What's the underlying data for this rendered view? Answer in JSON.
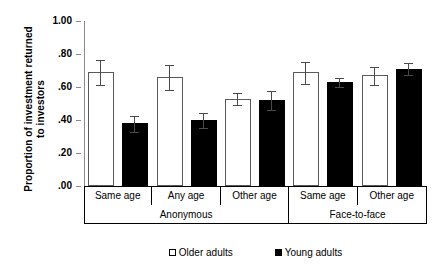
{
  "chart_data": {
    "type": "bar",
    "title": "",
    "xlabel": "",
    "ylabel": "Proportion of investment returned to investors",
    "ylabel_line1": "Proportion of investment returned",
    "ylabel_line2": "to investors",
    "ylim": [
      0.0,
      1.0
    ],
    "ytick_values": [
      0.0,
      0.2,
      0.4,
      0.6,
      0.8,
      1.0
    ],
    "ytick_labels": [
      ".00",
      ".20",
      ".40",
      ".60",
      ".80",
      "1.00"
    ],
    "grid": false,
    "legend_position": "bottom-center",
    "categories": [
      "Same age",
      "Any age",
      "Other age",
      "Same age",
      "Other age"
    ],
    "supergroups": [
      {
        "label": "Anonymous",
        "span": 3
      },
      {
        "label": "Face-to-face",
        "span": 2
      }
    ],
    "series": [
      {
        "name": "Older adults",
        "color": "#ffffff",
        "edge_color": "#5a5a5a",
        "values": [
          0.69,
          0.66,
          0.53,
          0.69,
          0.67
        ],
        "err_low": [
          0.08,
          0.08,
          0.04,
          0.07,
          0.06
        ],
        "err_high": [
          0.08,
          0.08,
          0.04,
          0.07,
          0.06
        ]
      },
      {
        "name": "Young adults",
        "color": "#000000",
        "edge_color": "#000000",
        "values": [
          0.38,
          0.4,
          0.52,
          0.63,
          0.71
        ],
        "err_low": [
          0.05,
          0.05,
          0.06,
          0.03,
          0.04
        ],
        "err_high": [
          0.05,
          0.05,
          0.06,
          0.03,
          0.04
        ]
      }
    ],
    "legend": [
      {
        "label": "Older adults",
        "marker": "open-square"
      },
      {
        "label": "Young adults",
        "marker": "filled-square"
      }
    ]
  }
}
